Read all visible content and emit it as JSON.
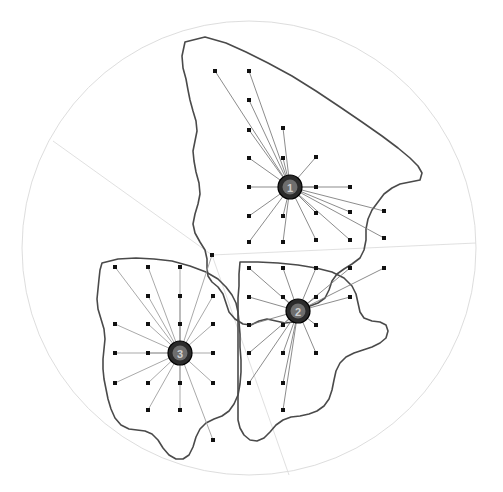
{
  "figure": {
    "title": "",
    "type": "facility-location-map",
    "background_color": "#ffffff",
    "width": 503,
    "height": 492
  },
  "colors": {
    "outline": "#4a4a4a",
    "spoke": "#777777",
    "spoke_light": "#9a9a9a",
    "point": "#111111",
    "hub_fill": "#2b2b2b",
    "hub_label": "#cfcfcf",
    "partition": "#dcdcdc",
    "circle": "#d9d9d9"
  },
  "bounding_circle": {
    "cx": 249,
    "cy": 248,
    "r": 227
  },
  "partition": {
    "vertex": {
      "x": 212,
      "y": 255
    },
    "edges": [
      {
        "name": "edge-northwest",
        "x1": 212,
        "y1": 255,
        "x2": 53,
        "y2": 141
      },
      {
        "name": "edge-east",
        "x1": 212,
        "y1": 255,
        "x2": 476,
        "y2": 243
      },
      {
        "name": "edge-south",
        "x1": 212,
        "y1": 255,
        "x2": 289,
        "y2": 475
      }
    ]
  },
  "hubs": [
    {
      "id": 1,
      "label": "1",
      "x": 290,
      "y": 187,
      "r": 12
    },
    {
      "id": 2,
      "label": "2",
      "x": 298,
      "y": 311,
      "r": 12
    },
    {
      "id": 3,
      "label": "3",
      "x": 180,
      "y": 353,
      "r": 12
    }
  ],
  "demand_points": [
    {
      "x": 215,
      "y": 71,
      "hub": 1
    },
    {
      "x": 249,
      "y": 71,
      "hub": 1
    },
    {
      "x": 249,
      "y": 100,
      "hub": 1
    },
    {
      "x": 249,
      "y": 130,
      "hub": 1
    },
    {
      "x": 283,
      "y": 128,
      "hub": 1
    },
    {
      "x": 249,
      "y": 158,
      "hub": 1
    },
    {
      "x": 283,
      "y": 158,
      "hub": 1
    },
    {
      "x": 316,
      "y": 157,
      "hub": 1
    },
    {
      "x": 249,
      "y": 187,
      "hub": 1
    },
    {
      "x": 316,
      "y": 187,
      "hub": 1
    },
    {
      "x": 350,
      "y": 187,
      "hub": 1
    },
    {
      "x": 249,
      "y": 216,
      "hub": 1
    },
    {
      "x": 283,
      "y": 216,
      "hub": 1
    },
    {
      "x": 316,
      "y": 213,
      "hub": 1
    },
    {
      "x": 350,
      "y": 212,
      "hub": 1
    },
    {
      "x": 384,
      "y": 211,
      "hub": 1
    },
    {
      "x": 249,
      "y": 242,
      "hub": 1
    },
    {
      "x": 283,
      "y": 242,
      "hub": 1
    },
    {
      "x": 316,
      "y": 240,
      "hub": 1
    },
    {
      "x": 350,
      "y": 240,
      "hub": 1
    },
    {
      "x": 384,
      "y": 238,
      "hub": 1
    },
    {
      "x": 249,
      "y": 268,
      "hub": 2
    },
    {
      "x": 283,
      "y": 268,
      "hub": 2
    },
    {
      "x": 316,
      "y": 268,
      "hub": 2
    },
    {
      "x": 350,
      "y": 268,
      "hub": 2
    },
    {
      "x": 384,
      "y": 268,
      "hub": 2
    },
    {
      "x": 249,
      "y": 297,
      "hub": 2
    },
    {
      "x": 283,
      "y": 297,
      "hub": 2
    },
    {
      "x": 316,
      "y": 297,
      "hub": 2
    },
    {
      "x": 350,
      "y": 297,
      "hub": 2
    },
    {
      "x": 249,
      "y": 325,
      "hub": 2
    },
    {
      "x": 283,
      "y": 325,
      "hub": 2
    },
    {
      "x": 316,
      "y": 325,
      "hub": 2
    },
    {
      "x": 249,
      "y": 353,
      "hub": 2
    },
    {
      "x": 283,
      "y": 353,
      "hub": 2
    },
    {
      "x": 316,
      "y": 353,
      "hub": 2
    },
    {
      "x": 283,
      "y": 383,
      "hub": 2
    },
    {
      "x": 249,
      "y": 383,
      "hub": 2
    },
    {
      "x": 283,
      "y": 410,
      "hub": 2
    },
    {
      "x": 212,
      "y": 255,
      "hub": 3
    },
    {
      "x": 115,
      "y": 267,
      "hub": 3
    },
    {
      "x": 148,
      "y": 267,
      "hub": 3
    },
    {
      "x": 180,
      "y": 267,
      "hub": 3
    },
    {
      "x": 213,
      "y": 296,
      "hub": 3
    },
    {
      "x": 148,
      "y": 296,
      "hub": 3
    },
    {
      "x": 180,
      "y": 296,
      "hub": 3
    },
    {
      "x": 115,
      "y": 324,
      "hub": 3
    },
    {
      "x": 148,
      "y": 324,
      "hub": 3
    },
    {
      "x": 180,
      "y": 324,
      "hub": 3
    },
    {
      "x": 213,
      "y": 324,
      "hub": 3
    },
    {
      "x": 115,
      "y": 353,
      "hub": 3
    },
    {
      "x": 148,
      "y": 353,
      "hub": 3
    },
    {
      "x": 213,
      "y": 353,
      "hub": 3
    },
    {
      "x": 115,
      "y": 383,
      "hub": 3
    },
    {
      "x": 148,
      "y": 383,
      "hub": 3
    },
    {
      "x": 180,
      "y": 383,
      "hub": 3
    },
    {
      "x": 213,
      "y": 383,
      "hub": 3
    },
    {
      "x": 148,
      "y": 410,
      "hub": 3
    },
    {
      "x": 180,
      "y": 410,
      "hub": 3
    },
    {
      "x": 213,
      "y": 440,
      "hub": 3
    }
  ],
  "region_outlines": [
    {
      "name": "region-north",
      "points": "185,42 205,38 222,42 240,50 258,58 272,66 285,72 300,80 318,92 333,104 350,116 365,128 378,140 390,150 398,156 406,160 412,166 418,172 420,178 414,180 404,182 396,184 388,188 380,194 374,200 368,206 364,212 360,220 358,228 356,238 356,248 355,258 350,264 344,268 338,272 334,276 330,282 328,290 326,298 322,302 316,304 310,306 306,310 304,316 300,320 292,322 284,322 276,320 268,318 262,320 256,324 250,326 244,324 238,320 232,316 228,310 226,304 224,298 222,292 218,286 212,282 208,278 206,272 206,266 206,258 206,252 204,246 200,240 196,234 194,228 194,222 196,214 198,206 200,198 200,190 198,182 196,174 194,166 192,158 192,150 194,142 196,134 196,126 194,118 192,110 190,102 188,94 186,86 184,78 182,70 181,62 182,52 185,42"
    }
  ],
  "axes": {
    "visible": false
  },
  "legend": {
    "visible": false
  }
}
